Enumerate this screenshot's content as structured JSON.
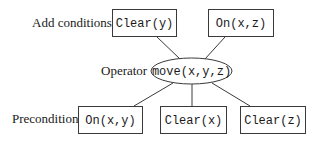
{
  "diagram": {
    "type": "operator-schema",
    "row_labels": {
      "add": "Add conditions",
      "operator": "Operator",
      "precondition": "Precondition"
    },
    "operator": {
      "label": "move(x,y,z)",
      "shape": "ellipse"
    },
    "add_conditions": [
      {
        "label": "Clear(y)"
      },
      {
        "label": "On(x,z)"
      }
    ],
    "preconditions": [
      {
        "label": "On(x,y)"
      },
      {
        "label": "Clear(x)"
      },
      {
        "label": "Clear(z)"
      }
    ],
    "edges": [
      {
        "from": "Clear(y)",
        "to": "move(x,y,z)"
      },
      {
        "from": "On(x,z)",
        "to": "move(x,y,z)"
      },
      {
        "from": "move(x,y,z)",
        "to": "On(x,y)"
      },
      {
        "from": "move(x,y,z)",
        "to": "Clear(x)"
      },
      {
        "from": "move(x,y,z)",
        "to": "Clear(z)"
      }
    ],
    "colors": {
      "stroke": "#3a3a3a",
      "text": "#1a1a1a",
      "background": "#ffffff"
    }
  }
}
